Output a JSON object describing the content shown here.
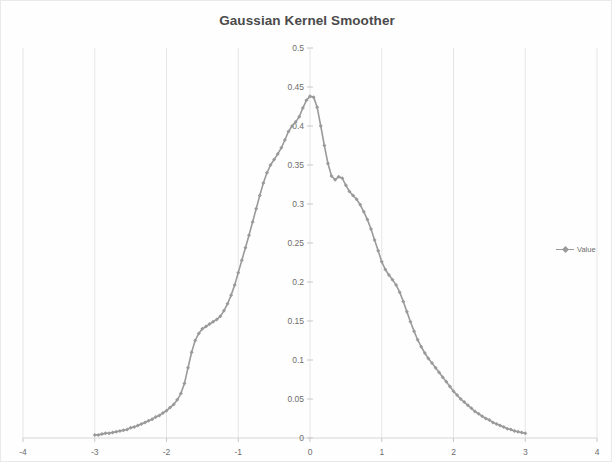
{
  "chart": {
    "title": "Gaussian Kernel Smoother",
    "legend": {
      "position": "right",
      "entries": [
        "Value"
      ]
    }
  },
  "legend_label": "Value",
  "axes": {
    "x_ticks": [
      "-4",
      "-3",
      "-2",
      "-1",
      "0",
      "1",
      "2",
      "3",
      "4"
    ],
    "y_ticks": [
      "0",
      "0.05",
      "0.1",
      "0.15",
      "0.2",
      "0.25",
      "0.3",
      "0.35",
      "0.4",
      "0.45",
      "0.5"
    ]
  },
  "colors": {
    "series": "#9a9a9a",
    "grid": "#e6e6e6",
    "axis": "#d6d6d6",
    "text": "#6d6d6d",
    "title": "#4a4a4a"
  },
  "chart_data": {
    "type": "line",
    "title": "Gaussian Kernel Smoother",
    "xlabel": "",
    "ylabel": "",
    "xlim": [
      -4,
      4
    ],
    "ylim": [
      0,
      0.5
    ],
    "xtick_step": 1,
    "ytick_step": 0.05,
    "grid": "vertical",
    "legend": "right",
    "markers": "diamond",
    "series": [
      {
        "name": "Value",
        "x": [
          -3.0,
          -2.95,
          -2.9,
          -2.85,
          -2.8,
          -2.75,
          -2.7,
          -2.65,
          -2.6,
          -2.55,
          -2.5,
          -2.45,
          -2.4,
          -2.35,
          -2.3,
          -2.25,
          -2.2,
          -2.15,
          -2.1,
          -2.05,
          -2.0,
          -1.95,
          -1.9,
          -1.85,
          -1.8,
          -1.75,
          -1.7,
          -1.65,
          -1.6,
          -1.55,
          -1.5,
          -1.45,
          -1.4,
          -1.35,
          -1.3,
          -1.25,
          -1.2,
          -1.15,
          -1.1,
          -1.05,
          -1.0,
          -0.95,
          -0.9,
          -0.85,
          -0.8,
          -0.75,
          -0.7,
          -0.65,
          -0.6,
          -0.55,
          -0.5,
          -0.45,
          -0.4,
          -0.35,
          -0.3,
          -0.25,
          -0.2,
          -0.15,
          -0.1,
          -0.05,
          0.0,
          0.05,
          0.1,
          0.15,
          0.2,
          0.25,
          0.3,
          0.35,
          0.4,
          0.45,
          0.5,
          0.55,
          0.6,
          0.65,
          0.7,
          0.75,
          0.8,
          0.85,
          0.9,
          0.95,
          1.0,
          1.05,
          1.1,
          1.15,
          1.2,
          1.25,
          1.3,
          1.35,
          1.4,
          1.45,
          1.5,
          1.55,
          1.6,
          1.65,
          1.7,
          1.75,
          1.8,
          1.85,
          1.9,
          1.95,
          2.0,
          2.05,
          2.1,
          2.15,
          2.2,
          2.25,
          2.3,
          2.35,
          2.4,
          2.45,
          2.5,
          2.55,
          2.6,
          2.65,
          2.7,
          2.75,
          2.8,
          2.85,
          2.9,
          2.95,
          3.0
        ],
        "y": [
          0.004,
          0.004,
          0.005,
          0.006,
          0.006,
          0.007,
          0.008,
          0.009,
          0.01,
          0.011,
          0.013,
          0.014,
          0.016,
          0.018,
          0.02,
          0.022,
          0.024,
          0.027,
          0.029,
          0.032,
          0.035,
          0.039,
          0.043,
          0.049,
          0.057,
          0.07,
          0.09,
          0.11,
          0.125,
          0.134,
          0.14,
          0.143,
          0.146,
          0.149,
          0.152,
          0.156,
          0.163,
          0.172,
          0.183,
          0.196,
          0.212,
          0.228,
          0.244,
          0.26,
          0.277,
          0.294,
          0.311,
          0.327,
          0.34,
          0.35,
          0.357,
          0.364,
          0.372,
          0.382,
          0.393,
          0.4,
          0.405,
          0.412,
          0.423,
          0.433,
          0.438,
          0.437,
          0.424,
          0.4,
          0.375,
          0.352,
          0.336,
          0.331,
          0.335,
          0.333,
          0.324,
          0.316,
          0.311,
          0.306,
          0.299,
          0.29,
          0.28,
          0.268,
          0.254,
          0.24,
          0.226,
          0.216,
          0.209,
          0.203,
          0.196,
          0.187,
          0.175,
          0.162,
          0.149,
          0.137,
          0.126,
          0.117,
          0.109,
          0.102,
          0.096,
          0.09,
          0.084,
          0.078,
          0.072,
          0.066,
          0.06,
          0.055,
          0.05,
          0.046,
          0.042,
          0.038,
          0.034,
          0.031,
          0.028,
          0.025,
          0.023,
          0.02,
          0.018,
          0.016,
          0.014,
          0.012,
          0.011,
          0.009,
          0.008,
          0.007,
          0.006
        ]
      }
    ]
  }
}
